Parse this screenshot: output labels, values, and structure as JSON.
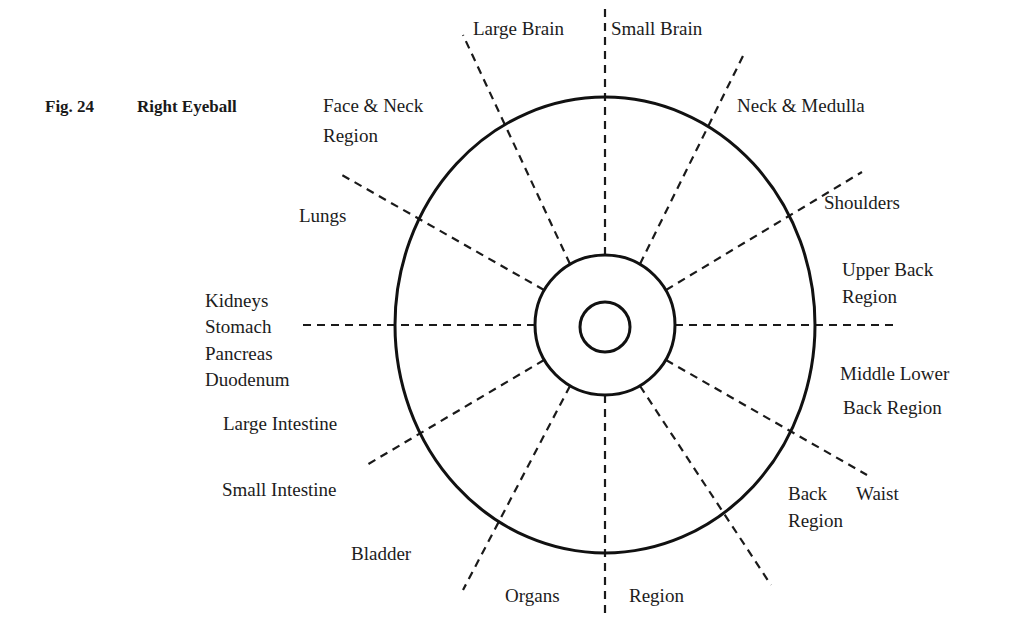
{
  "figure": {
    "number": "Fig. 24",
    "title": "Right Eyeball"
  },
  "diagram": {
    "type": "iridology-chart",
    "center": [
      605,
      325
    ],
    "rings": {
      "outer": {
        "rx": 210,
        "ry": 228
      },
      "middle": {
        "r": 70
      },
      "inner": {
        "r": 25
      }
    },
    "colors": {
      "line": "#111111",
      "text": "#1c1c1c",
      "background": "#ffffff"
    }
  },
  "labels": {
    "large_brain": "Large Brain",
    "small_brain": "Small Brain",
    "neck_medulla": "Neck & Medulla",
    "shoulders": "Shoulders",
    "upper_back_1": "Upper Back",
    "upper_back_2": "Region",
    "middle_lower_1": "Middle Lower",
    "middle_lower_2": "Back   Region",
    "waist_back": "Back",
    "waist": "Waist",
    "waist_region": "Region",
    "region_bottom": "Region",
    "organs": "Organs",
    "bladder": "Bladder",
    "small_intestine": "Small   Intestine",
    "large_intestine": "Large Intestine",
    "kidneys": "Kidneys",
    "stomach": "Stomach",
    "pancreas": "Pancreas",
    "duodenum": "Duodenum",
    "lungs": "Lungs",
    "face_neck_1": "Face & Neck",
    "face_neck_2": "Region"
  }
}
